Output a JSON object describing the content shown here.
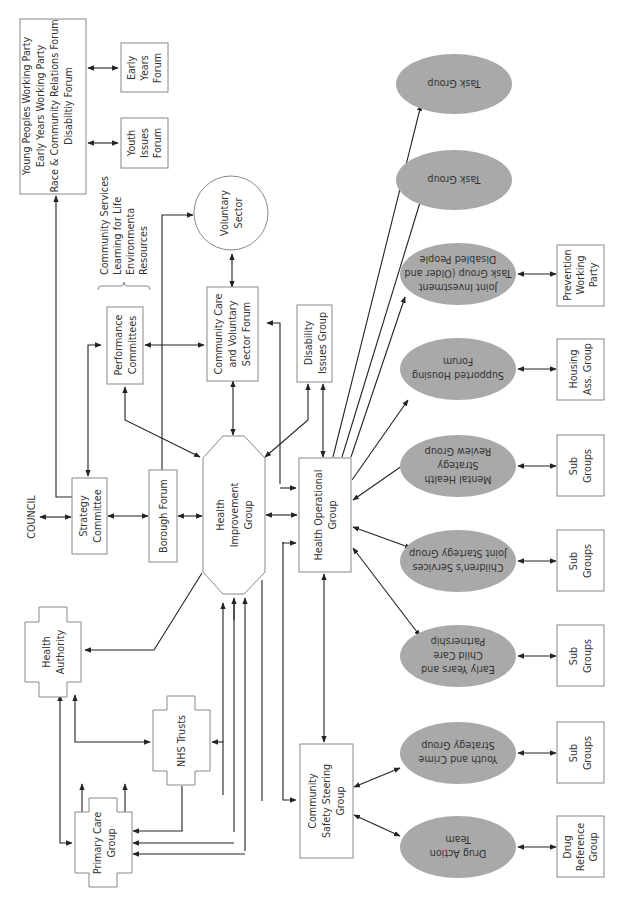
{
  "diagram": {
    "orientation": "rotated 90deg counter-clockwise",
    "colors": {
      "line": "#222222",
      "box_border": "#888888",
      "ellipse_fill": "#a9a9a9",
      "text": "#333333"
    },
    "nodes": {
      "council": {
        "label": "COUNCIL"
      },
      "strategy_committee": {
        "lines": [
          "Strategy",
          "Committee"
        ]
      },
      "borough_forum": {
        "lines": [
          "Borough Forum"
        ]
      },
      "health_improvement_group": {
        "lines": [
          "Health",
          "Improvement",
          "Group"
        ]
      },
      "health_operational_group": {
        "lines": [
          "Health Operational",
          "Group"
        ]
      },
      "performance_committees": {
        "lines": [
          "Performance",
          "Committees"
        ]
      },
      "performance_list": {
        "lines": [
          "Community Services",
          "Learning for Life",
          "Environmenta",
          "Resources"
        ]
      },
      "community_care_forum": {
        "lines": [
          "Community Care",
          "and Voluntary",
          "Sector Forum"
        ]
      },
      "voluntary_sector": {
        "lines": [
          "Voluntary",
          "Sector"
        ]
      },
      "disability_issues_group": {
        "lines": [
          "Disability",
          "Issues Group"
        ]
      },
      "forums_box": {
        "lines": [
          "Young Peoples Working Party",
          "Early Years Working Party",
          "Race & Community Relations Forum",
          "Disabiltiy Forum"
        ]
      },
      "early_years_forum": {
        "lines": [
          "Early",
          "Years",
          "Forum"
        ]
      },
      "youth_issues_forum": {
        "lines": [
          "Youth",
          "Issues",
          "Forum"
        ]
      },
      "health_authority": {
        "lines": [
          "Health",
          "Authority"
        ]
      },
      "nhs_trusts": {
        "lines": [
          "NHS Trusts"
        ]
      },
      "primary_care_group": {
        "lines": [
          "Primary Care",
          "Group"
        ]
      },
      "community_safety": {
        "lines": [
          "Community",
          "Safety Steering",
          "Group"
        ]
      }
    },
    "ellipses": [
      {
        "id": "task_group_1",
        "lines": [
          "Task Group"
        ]
      },
      {
        "id": "task_group_2",
        "lines": [
          "Task Group"
        ]
      },
      {
        "id": "joint_investment",
        "lines": [
          "Joint Investment",
          "Task Group (Older and",
          "Disabled People"
        ]
      },
      {
        "id": "supported_housing",
        "lines": [
          "Supported Housing",
          "Forum"
        ]
      },
      {
        "id": "mental_health",
        "lines": [
          "Mental Health",
          "Strategy",
          "Review Group"
        ]
      },
      {
        "id": "childrens_services",
        "lines": [
          "Children's Services",
          "Joint Startegy Group"
        ]
      },
      {
        "id": "early_years_childcare",
        "lines": [
          "Early Years and",
          "Child Care",
          "Partnership"
        ]
      },
      {
        "id": "youth_crime",
        "lines": [
          "Youth and Crime",
          "Strategy Group"
        ]
      },
      {
        "id": "drug_action",
        "lines": [
          "Drug Action",
          "Team"
        ]
      }
    ],
    "sub_boxes": [
      {
        "id": "prevention_working_party",
        "lines": [
          "Prevention",
          "Working",
          "Party"
        ]
      },
      {
        "id": "housing_ass_group",
        "lines": [
          "Housing",
          "Ass. Group"
        ]
      },
      {
        "id": "sub_groups_mental",
        "lines": [
          "Sub",
          "Groups"
        ]
      },
      {
        "id": "sub_groups_children",
        "lines": [
          "Sub",
          "Groups"
        ]
      },
      {
        "id": "sub_groups_early",
        "lines": [
          "Sub",
          "Groups"
        ]
      },
      {
        "id": "sub_groups_youth",
        "lines": [
          "Sub",
          "Groups"
        ]
      },
      {
        "id": "drug_reference_group",
        "lines": [
          "Drug",
          "Reference",
          "Group"
        ]
      }
    ]
  }
}
